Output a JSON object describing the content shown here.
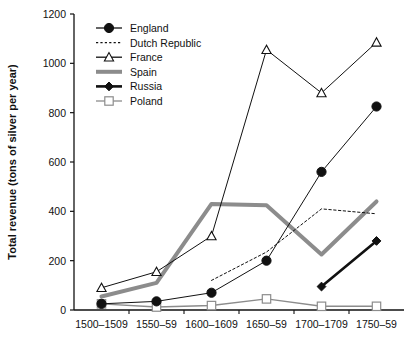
{
  "chart_data": {
    "type": "line",
    "title": "",
    "xlabel": "",
    "ylabel": "Total revenue (tons of silver per year)",
    "categories": [
      "1500–1509",
      "1550–59",
      "1600–1609",
      "1650–59",
      "1700–1709",
      "1750–59"
    ],
    "ylim": [
      0,
      1200
    ],
    "yticks": [
      0,
      200,
      400,
      600,
      800,
      1000,
      1200
    ],
    "ytick_labels": [
      "0",
      "200",
      "400",
      "600",
      "800",
      "1000",
      "1200"
    ],
    "grid": false,
    "legend_position": "top-left",
    "series": [
      {
        "name": "England",
        "color": "#111111",
        "marker": "filled-circle",
        "line_style": "solid",
        "line_width": 1,
        "values": [
          25,
          35,
          70,
          200,
          560,
          825
        ]
      },
      {
        "name": "Dutch Republic",
        "color": "#111111",
        "marker": "none",
        "line_style": "dotted",
        "line_width": 1,
        "values": [
          null,
          null,
          120,
          235,
          410,
          390
        ]
      },
      {
        "name": "France",
        "color": "#111111",
        "marker": "open-triangle",
        "line_style": "solid",
        "line_width": 1,
        "values": [
          90,
          155,
          300,
          1055,
          880,
          1085
        ]
      },
      {
        "name": "Spain",
        "color": "#8c8c8c",
        "marker": "none",
        "line_style": "solid",
        "line_width": 4,
        "values": [
          55,
          110,
          430,
          425,
          225,
          440
        ]
      },
      {
        "name": "Russia",
        "color": "#111111",
        "marker": "filled-diamond",
        "line_style": "solid",
        "line_width": 2.6,
        "values": [
          null,
          null,
          null,
          null,
          95,
          280
        ]
      },
      {
        "name": "Poland",
        "color": "#8c8c8c",
        "marker": "open-square",
        "line_style": "solid",
        "line_width": 1.4,
        "values": [
          25,
          12,
          18,
          45,
          15,
          15
        ]
      }
    ]
  }
}
